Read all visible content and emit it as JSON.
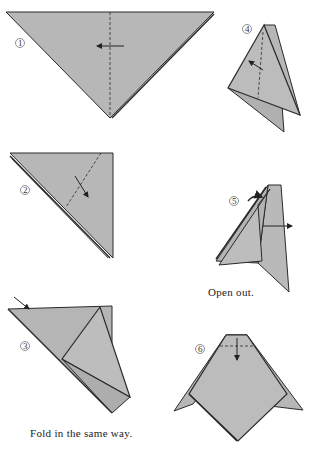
{
  "diagram": {
    "type": "origami-instructions",
    "paper_color": "#b7b7b7",
    "line_color": "#2a2a2a",
    "steps": [
      {
        "number": "1",
        "label": "①",
        "caption": ""
      },
      {
        "number": "2",
        "label": "②",
        "caption": ""
      },
      {
        "number": "3",
        "label": "③",
        "caption": "Fold in the same way."
      },
      {
        "number": "4",
        "label": "④",
        "caption": ""
      },
      {
        "number": "5",
        "label": "⑤",
        "caption": "Open out."
      },
      {
        "number": "6",
        "label": "⑥",
        "caption": ""
      }
    ]
  }
}
